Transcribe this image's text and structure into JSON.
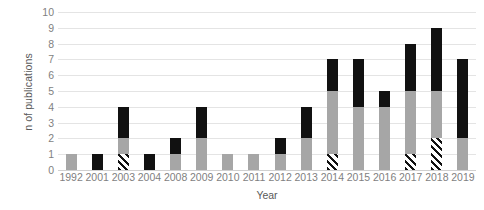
{
  "chart_data": {
    "type": "bar",
    "stacked": true,
    "title": "",
    "xlabel": "Year",
    "ylabel": "n of publications",
    "ylim": [
      0,
      10
    ],
    "ytick_values": [
      0,
      1,
      2,
      3,
      4,
      5,
      6,
      7,
      8,
      9,
      10
    ],
    "ytick_labels": [
      "0",
      "1",
      "2",
      "3",
      "4",
      "5",
      "6",
      "7",
      "8",
      "9",
      "10"
    ],
    "grid": true,
    "legend": "none",
    "categories": [
      "1992",
      "2001",
      "2003",
      "2004",
      "2008",
      "2009",
      "2010",
      "2011",
      "2012",
      "2013",
      "2014",
      "2015",
      "2016",
      "2017",
      "2018",
      "2019"
    ],
    "series": [
      {
        "name": "hatched",
        "fill": "diagonal-hatch",
        "color": "#111111",
        "values": [
          0,
          0,
          1,
          0,
          0,
          0,
          0,
          0,
          0,
          0,
          1,
          0,
          0,
          1,
          2,
          0
        ]
      },
      {
        "name": "gray",
        "fill": "solid",
        "color": "#a6a6a6",
        "values": [
          1,
          0,
          1,
          0,
          1,
          2,
          1,
          1,
          1,
          2,
          4,
          4,
          4,
          4,
          3,
          2
        ]
      },
      {
        "name": "black",
        "fill": "solid",
        "color": "#111111",
        "values": [
          0,
          1,
          2,
          1,
          1,
          2,
          0,
          0,
          1,
          2,
          2,
          3,
          1,
          3,
          4,
          5
        ]
      }
    ],
    "totals": [
      1,
      1,
      4,
      1,
      2,
      4,
      1,
      1,
      2,
      4,
      7,
      7,
      5,
      8,
      9,
      7
    ]
  },
  "colors": {
    "gray_segment": "#a6a6a6",
    "black_segment": "#111111",
    "gridline": "#e4e4e4",
    "tick_text": "#7f7f7f",
    "axis_title_text": "#595959",
    "background": "#ffffff"
  }
}
